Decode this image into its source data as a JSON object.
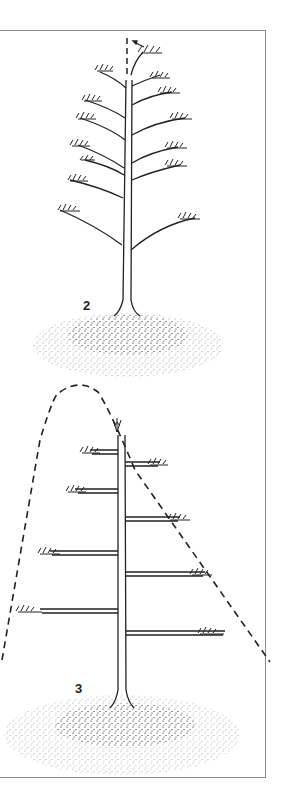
{
  "figure": {
    "type": "bonsai training illustration",
    "panels": [
      {
        "label": "2",
        "description": "Tree with upward-angled branches; leader dashed vertical guide line with arrow bending top shoot"
      },
      {
        "label": "3",
        "description": "Trained tree with horizontal branch tiers inside a dashed triangular/dome silhouette"
      }
    ]
  },
  "colors": {
    "ink": "#222222",
    "frame": "#8a8a8a",
    "background": "#ffffff"
  }
}
